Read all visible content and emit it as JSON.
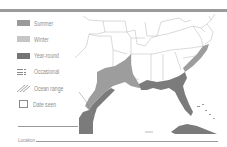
{
  "header": {
    "caption_cut_off": "",
    "rule_color": "#9a9a9a"
  },
  "legend": {
    "items": [
      {
        "id": "summer",
        "label": "Summer",
        "color": "#9a9a9a",
        "icon": "solid-swatch"
      },
      {
        "id": "winter",
        "label": "Winter",
        "color": "#c4c4c4",
        "icon": "solid-swatch"
      },
      {
        "id": "year_round",
        "label": "Year-round",
        "color": "#7a7a7a",
        "icon": "solid-swatch"
      },
      {
        "id": "occasional",
        "label": "Occasional",
        "color": "#8a8a8a",
        "icon": "dashed-grid-icon"
      },
      {
        "id": "ocean_range",
        "label": "Ocean range",
        "color": "#8a8a8a",
        "icon": "hatch-lines-icon"
      },
      {
        "id": "date_seen",
        "label": "Date seen",
        "color": "#8a8a8a",
        "icon": "empty-box-icon"
      }
    ]
  },
  "form": {
    "signature_line": "",
    "location_label": "Location"
  },
  "map": {
    "region": "Southeastern United States, Mexico Gulf coast, Cuba",
    "colors": {
      "year_round": "#7d7d7d",
      "summer": "#9c9c9c",
      "borders": "#b0b0b0",
      "land": "#ffffff"
    }
  }
}
